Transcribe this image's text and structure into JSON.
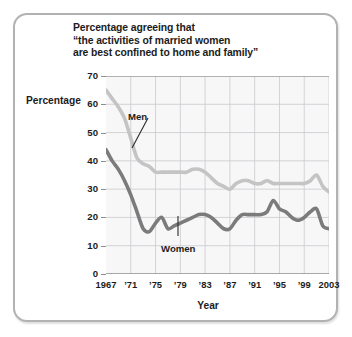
{
  "chart_data": {
    "type": "line",
    "title_lines": [
      "Percentage agreeing that",
      "“the activities of married women",
      "are best confined to home and family”"
    ],
    "xlabel": "Year",
    "ylabel": "Percentage",
    "ylim": [
      0,
      70
    ],
    "xlim": [
      1967,
      2003
    ],
    "yticks": [
      70,
      60,
      50,
      40,
      30,
      20,
      10,
      0
    ],
    "xticks": [
      1967,
      1971,
      1975,
      1979,
      1983,
      1987,
      1991,
      1995,
      1999,
      2003
    ],
    "xtick_labels": [
      "1967",
      "’71",
      "’75",
      "’79",
      "’83",
      "’87",
      "’91",
      "’95",
      "’99",
      "2003"
    ],
    "grid": true,
    "legend_position": "inline-annotations",
    "x": [
      1967,
      1968,
      1969,
      1970,
      1971,
      1972,
      1973,
      1974,
      1975,
      1976,
      1977,
      1978,
      1979,
      1980,
      1981,
      1982,
      1983,
      1984,
      1985,
      1986,
      1987,
      1988,
      1989,
      1990,
      1991,
      1992,
      1993,
      1994,
      1995,
      1996,
      1997,
      1998,
      1999,
      2000,
      2001,
      2002,
      2003
    ],
    "series": [
      {
        "name": "Men",
        "color": "#c4c4c4",
        "annotation": "Men",
        "values": [
          65,
          62,
          59,
          55,
          48,
          41,
          39,
          38,
          36,
          36,
          36,
          36,
          36,
          36,
          37,
          37,
          36,
          34,
          32,
          31,
          30,
          32,
          33,
          33,
          32,
          32,
          33,
          32,
          32,
          32,
          32,
          32,
          32,
          33,
          35,
          31,
          29
        ]
      },
      {
        "name": "Women",
        "color": "#7b7b7b",
        "annotation": "Women",
        "values": [
          44,
          40,
          37,
          33,
          28,
          22,
          16,
          15,
          18,
          20,
          16,
          17,
          18,
          19,
          20,
          21,
          21,
          20,
          18,
          16,
          16,
          19,
          21,
          21,
          21,
          21,
          22,
          26,
          23,
          22,
          20,
          19,
          20,
          22,
          23,
          17,
          16
        ]
      }
    ]
  },
  "annotations": {
    "men_label": "Men",
    "women_label": "Women"
  },
  "colors": {
    "men": "#c4c4c4",
    "women": "#7b7b7b",
    "plot_background": "#f7f7f7",
    "grid": "#c9c9cf",
    "axis": "#8e8e8e",
    "frame": "#b2b2b2",
    "text": "#1c1c1c"
  }
}
